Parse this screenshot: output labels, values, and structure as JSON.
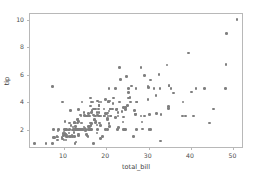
{
  "chart_data": {
    "type": "scatter",
    "title": "",
    "xlabel": "total_bill",
    "ylabel": "tip",
    "xlim": [
      2.0,
      52.5
    ],
    "ylim": [
      0.6,
      10.4
    ],
    "xticks": [
      10,
      20,
      30,
      40,
      50
    ],
    "yticks": [
      2,
      4,
      6,
      8,
      10
    ],
    "grid": false,
    "legend": null,
    "marker": {
      "shape": "circle",
      "color": "#7f7f7f",
      "size": 3
    },
    "series": [
      {
        "name": "tips",
        "x": [
          16.99,
          10.34,
          21.01,
          23.68,
          24.59,
          25.29,
          8.77,
          26.88,
          15.04,
          14.78,
          10.27,
          35.26,
          15.42,
          18.43,
          14.83,
          21.58,
          10.33,
          16.29,
          16.97,
          20.65,
          17.92,
          20.29,
          15.77,
          39.42,
          19.82,
          17.81,
          13.37,
          12.69,
          21.7,
          19.65,
          9.55,
          18.35,
          15.06,
          20.69,
          17.78,
          24.06,
          16.31,
          16.93,
          18.69,
          31.27,
          16.04,
          17.46,
          13.94,
          9.68,
          30.4,
          18.29,
          22.23,
          32.4,
          28.55,
          18.04,
          12.54,
          10.29,
          34.81,
          9.94,
          25.56,
          19.49,
          38.01,
          26.41,
          11.24,
          48.27,
          20.29,
          13.81,
          11.02,
          18.29,
          17.59,
          20.08,
          16.45,
          3.07,
          20.23,
          15.01,
          12.02,
          17.07,
          26.86,
          25.28,
          14.73,
          10.51,
          17.92,
          27.2,
          22.76,
          17.29,
          19.44,
          16.66,
          10.07,
          32.68,
          15.98,
          34.83,
          13.03,
          18.28,
          24.71,
          21.16,
          28.97,
          22.49,
          5.75,
          16.32,
          22.75,
          40.17,
          27.28,
          12.03,
          21.01,
          12.46,
          11.35,
          15.38,
          44.3,
          22.42,
          20.92,
          15.36,
          20.49,
          25.21,
          18.24,
          14.31,
          14.0,
          7.25,
          38.07,
          23.95,
          25.71,
          17.31,
          29.93,
          10.65,
          12.43,
          24.08,
          11.69,
          13.42,
          14.26,
          15.95,
          12.48,
          29.8,
          8.52,
          14.52,
          11.38,
          22.82,
          19.08,
          20.27,
          11.17,
          12.26,
          18.26,
          8.51,
          10.33,
          14.15,
          16.0,
          13.16,
          17.47,
          34.3,
          41.19,
          27.05,
          16.43,
          8.35,
          18.64,
          11.87,
          9.78,
          7.51,
          14.07,
          13.13,
          17.26,
          24.55,
          19.77,
          29.85,
          48.17,
          25.0,
          13.39,
          16.49,
          21.5,
          12.66,
          16.21,
          13.81,
          17.51,
          24.52,
          20.76,
          31.71,
          10.59,
          10.63,
          50.81,
          15.81,
          7.25,
          31.85,
          16.82,
          32.9,
          17.89,
          14.48,
          9.6,
          34.63,
          34.65,
          23.33,
          45.35,
          23.17,
          40.55,
          20.69,
          20.9,
          30.46,
          18.15,
          23.1,
          15.69,
          19.81,
          28.44,
          15.48,
          16.58,
          7.56,
          10.34,
          43.11,
          13.0,
          13.51,
          18.71,
          12.74,
          13.0,
          16.4,
          20.53,
          16.47,
          26.59,
          38.73,
          24.27,
          12.76,
          30.06,
          25.89,
          48.33,
          13.27,
          28.17,
          12.9,
          28.15,
          11.59,
          7.74,
          30.14,
          12.16,
          13.42,
          8.58,
          15.98,
          13.42,
          16.27,
          10.09,
          20.45,
          13.28,
          22.12,
          24.01,
          15.69,
          11.61,
          10.77,
          15.53,
          10.07,
          12.6,
          32.83,
          35.83,
          29.03,
          27.18,
          22.67,
          17.82,
          18.78
        ],
        "y": [
          1.01,
          1.66,
          3.5,
          3.31,
          3.61,
          4.71,
          2.0,
          3.12,
          1.96,
          3.23,
          1.71,
          5.0,
          1.57,
          3.0,
          3.02,
          3.92,
          1.67,
          3.71,
          3.5,
          3.35,
          4.08,
          2.75,
          2.23,
          7.58,
          3.18,
          2.34,
          2.0,
          2.0,
          4.3,
          3.0,
          1.45,
          2.5,
          3.0,
          2.45,
          3.27,
          3.6,
          2.0,
          3.07,
          2.31,
          5.0,
          2.24,
          2.54,
          3.06,
          1.32,
          5.6,
          3.0,
          5.0,
          6.0,
          2.05,
          3.0,
          2.5,
          2.6,
          5.2,
          1.56,
          4.34,
          3.51,
          3.0,
          1.5,
          1.76,
          6.73,
          3.21,
          2.0,
          1.98,
          3.76,
          2.64,
          3.15,
          2.47,
          1.0,
          2.01,
          2.09,
          1.97,
          3.0,
          3.14,
          5.0,
          2.2,
          1.25,
          3.08,
          4.0,
          3.0,
          2.71,
          3.0,
          3.4,
          1.83,
          5.0,
          2.03,
          5.17,
          2.0,
          4.0,
          5.85,
          3.0,
          3.0,
          3.5,
          1.0,
          4.3,
          3.25,
          4.73,
          4.0,
          1.5,
          3.0,
          1.5,
          2.5,
          3.0,
          2.5,
          3.48,
          4.08,
          1.64,
          4.06,
          4.29,
          3.76,
          4.0,
          3.0,
          1.0,
          4.0,
          2.55,
          4.0,
          3.5,
          5.07,
          1.5,
          1.8,
          2.92,
          2.31,
          1.68,
          2.5,
          2.0,
          2.52,
          4.2,
          1.48,
          2.0,
          2.0,
          2.18,
          1.5,
          2.83,
          1.5,
          2.0,
          3.25,
          1.25,
          2.0,
          2.0,
          2.0,
          2.75,
          3.5,
          6.7,
          5.0,
          5.0,
          2.3,
          1.5,
          1.36,
          1.63,
          1.73,
          2.0,
          2.5,
          2.0,
          2.74,
          2.0,
          2.0,
          5.14,
          5.0,
          3.75,
          2.61,
          2.0,
          3.5,
          2.5,
          2.0,
          2.0,
          3.0,
          3.48,
          2.24,
          4.5,
          1.61,
          2.0,
          10.0,
          3.16,
          5.15,
          3.18,
          4.0,
          3.11,
          2.0,
          2.0,
          4.0,
          3.55,
          3.68,
          5.65,
          3.5,
          6.5,
          3.0,
          5.0,
          3.5,
          2.0,
          3.5,
          4.0,
          1.5,
          4.19,
          2.56,
          2.02,
          4.0,
          1.44,
          2.0,
          5.0,
          2.0,
          2.0,
          4.0,
          2.0,
          2.0,
          2.5,
          4.0,
          3.23,
          3.41,
          3.0,
          2.03,
          2.23,
          2.0,
          5.16,
          9.0,
          2.5,
          6.5,
          1.1,
          3.0,
          1.5,
          1.44,
          3.09,
          2.2,
          3.48,
          1.92,
          3.0,
          1.58,
          2.5,
          2.0,
          3.0,
          2.72,
          2.88,
          2.0,
          3.0,
          3.39,
          1.47,
          3.0,
          1.25,
          1.0,
          1.17,
          4.67,
          5.92,
          2.0,
          2.0,
          1.75,
          3.0
        ]
      }
    ]
  },
  "axis": {
    "xlabel": "total_bill",
    "ylabel": "tip",
    "xtick_labels": [
      "10",
      "20",
      "30",
      "40",
      "50"
    ],
    "ytick_labels": [
      "2",
      "4",
      "6",
      "8",
      "10"
    ]
  }
}
